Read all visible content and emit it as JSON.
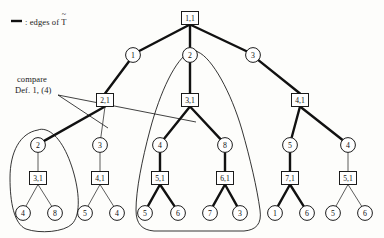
{
  "figure": {
    "type": "tree-diagram",
    "width": 384,
    "height": 238,
    "legend": {
      "symbol": "—",
      "separator": ":",
      "text": "edges of",
      "symbol_label": "T",
      "accent": "~",
      "full_text": "— : edges of T̃"
    },
    "annotation": {
      "line1": "compare",
      "line2": "Def. 1, (4)"
    },
    "colors": {
      "ink": "#111111",
      "thick_edge": "#111111",
      "thin_edge": "#333333",
      "background": "#fdfdfb"
    },
    "nodes": [
      {
        "id": "root",
        "label": "1,1",
        "shape": "box",
        "x": 190,
        "y": 18
      },
      {
        "id": "c1",
        "label": "1",
        "shape": "circle",
        "x": 133,
        "y": 55
      },
      {
        "id": "c2",
        "label": "2",
        "shape": "circle",
        "x": 190,
        "y": 55
      },
      {
        "id": "c3",
        "label": "3",
        "shape": "circle",
        "x": 253,
        "y": 55
      },
      {
        "id": "b21",
        "label": "2,1",
        "shape": "box",
        "x": 105,
        "y": 100
      },
      {
        "id": "b31",
        "label": "3,1",
        "shape": "box",
        "x": 190,
        "y": 100
      },
      {
        "id": "b41",
        "label": "4,1",
        "shape": "box",
        "x": 300,
        "y": 100
      },
      {
        "id": "d2",
        "label": "2",
        "shape": "circle",
        "x": 38,
        "y": 145
      },
      {
        "id": "d3",
        "label": "3",
        "shape": "circle",
        "x": 100,
        "y": 145
      },
      {
        "id": "d4",
        "label": "4",
        "shape": "circle",
        "x": 160,
        "y": 145
      },
      {
        "id": "d8",
        "label": "8",
        "shape": "circle",
        "x": 225,
        "y": 145
      },
      {
        "id": "d5",
        "label": "5",
        "shape": "circle",
        "x": 290,
        "y": 145
      },
      {
        "id": "d4b",
        "label": "4",
        "shape": "circle",
        "x": 348,
        "y": 145
      },
      {
        "id": "e31",
        "label": "3,1",
        "shape": "box",
        "x": 38,
        "y": 178
      },
      {
        "id": "e41",
        "label": "4,1",
        "shape": "box",
        "x": 100,
        "y": 178
      },
      {
        "id": "e51",
        "label": "5,1",
        "shape": "box",
        "x": 160,
        "y": 178
      },
      {
        "id": "e61",
        "label": "6,1",
        "shape": "box",
        "x": 225,
        "y": 178
      },
      {
        "id": "e71",
        "label": "7,1",
        "shape": "box",
        "x": 290,
        "y": 178
      },
      {
        "id": "e51b",
        "label": "5,1",
        "shape": "box",
        "x": 348,
        "y": 178
      },
      {
        "id": "f4",
        "label": "4",
        "shape": "circle",
        "x": 23,
        "y": 213
      },
      {
        "id": "f8",
        "label": "8",
        "shape": "circle",
        "x": 55,
        "y": 213
      },
      {
        "id": "f5",
        "label": "5",
        "shape": "circle",
        "x": 85,
        "y": 213
      },
      {
        "id": "f4b",
        "label": "4",
        "shape": "circle",
        "x": 117,
        "y": 213
      },
      {
        "id": "f5b",
        "label": "5",
        "shape": "circle",
        "x": 145,
        "y": 213
      },
      {
        "id": "f6",
        "label": "6",
        "shape": "circle",
        "x": 178,
        "y": 213
      },
      {
        "id": "f7",
        "label": "7",
        "shape": "circle",
        "x": 210,
        "y": 213
      },
      {
        "id": "f3",
        "label": "3",
        "shape": "circle",
        "x": 240,
        "y": 213
      },
      {
        "id": "f1",
        "label": "1",
        "shape": "circle",
        "x": 275,
        "y": 213
      },
      {
        "id": "f6b",
        "label": "6",
        "shape": "circle",
        "x": 307,
        "y": 213
      },
      {
        "id": "f5c",
        "label": "5",
        "shape": "circle",
        "x": 333,
        "y": 213
      },
      {
        "id": "f6c",
        "label": "6",
        "shape": "circle",
        "x": 365,
        "y": 213
      }
    ],
    "edges": [
      {
        "from": "root",
        "to": "c1",
        "weight": "thick"
      },
      {
        "from": "root",
        "to": "c2",
        "weight": "thick"
      },
      {
        "from": "root",
        "to": "c3",
        "weight": "thick"
      },
      {
        "from": "c1",
        "to": "b21",
        "weight": "thick"
      },
      {
        "from": "c2",
        "to": "b31",
        "weight": "thick"
      },
      {
        "from": "c3",
        "to": "b41",
        "weight": "thick"
      },
      {
        "from": "b21",
        "to": "d2",
        "weight": "thick"
      },
      {
        "from": "b21",
        "to": "d3",
        "weight": "thin"
      },
      {
        "from": "b31",
        "to": "d4",
        "weight": "thick"
      },
      {
        "from": "b31",
        "to": "d8",
        "weight": "thick"
      },
      {
        "from": "b41",
        "to": "d5",
        "weight": "thick"
      },
      {
        "from": "b41",
        "to": "d4b",
        "weight": "thick"
      },
      {
        "from": "d2",
        "to": "e31",
        "weight": "thin"
      },
      {
        "from": "d3",
        "to": "e41",
        "weight": "thin"
      },
      {
        "from": "d4",
        "to": "e51",
        "weight": "thick"
      },
      {
        "from": "d8",
        "to": "e61",
        "weight": "thick"
      },
      {
        "from": "d5",
        "to": "e71",
        "weight": "thick"
      },
      {
        "from": "d4b",
        "to": "e51b",
        "weight": "thin"
      },
      {
        "from": "e31",
        "to": "f4",
        "weight": "thin"
      },
      {
        "from": "e31",
        "to": "f8",
        "weight": "thin"
      },
      {
        "from": "e41",
        "to": "f5",
        "weight": "thin"
      },
      {
        "from": "e41",
        "to": "f4b",
        "weight": "thin"
      },
      {
        "from": "e51",
        "to": "f5b",
        "weight": "thick"
      },
      {
        "from": "e51",
        "to": "f6",
        "weight": "thick"
      },
      {
        "from": "e61",
        "to": "f7",
        "weight": "thick"
      },
      {
        "from": "e61",
        "to": "f3",
        "weight": "thick"
      },
      {
        "from": "e71",
        "to": "f1",
        "weight": "thick"
      },
      {
        "from": "e71",
        "to": "f6b",
        "weight": "thick"
      },
      {
        "from": "e51b",
        "to": "f5c",
        "weight": "thin"
      },
      {
        "from": "e51b",
        "to": "f6c",
        "weight": "thin"
      }
    ],
    "groups": [
      {
        "id": "group-left",
        "label": "subtree-2-31"
      },
      {
        "id": "group-center",
        "label": "subtree-31"
      }
    ],
    "leader_lines": 2
  }
}
